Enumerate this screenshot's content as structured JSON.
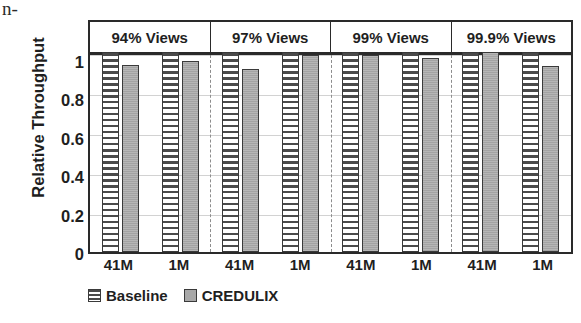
{
  "page_fragment": "n-",
  "chart_data": {
    "type": "bar",
    "title": "",
    "xlabel": "",
    "ylabel": "Relative Throughput",
    "ylim": [
      0,
      1
    ],
    "yticks": [
      0,
      0.2,
      0.4,
      0.6,
      0.8,
      1
    ],
    "ytick_labels": [
      "0",
      "0.2",
      "0.4",
      "0.6",
      "0.8",
      "1"
    ],
    "grid": true,
    "legend_position": "bottom-left",
    "group_labels": [
      "94% Views",
      "97% Views",
      "99% Views",
      "99.9% Views"
    ],
    "categories": [
      "41M",
      "1M",
      "41M",
      "1M",
      "41M",
      "1M",
      "41M",
      "1M"
    ],
    "series": [
      {
        "name": "Baseline",
        "color": "#ffffff",
        "pattern": "horizontal-stripes",
        "values": [
          1.0,
          1.0,
          1.0,
          1.0,
          1.0,
          1.0,
          1.0,
          1.0
        ]
      },
      {
        "name": "CREDULIX",
        "color": "#a8a8a8",
        "pattern": "solid",
        "values": [
          0.935,
          0.955,
          0.915,
          0.985,
          0.985,
          0.97,
          1.0,
          0.93
        ]
      }
    ],
    "groups": [
      {
        "label": "94% Views",
        "bars": [
          {
            "category": "41M",
            "baseline": 1.0,
            "credulix": 0.935
          },
          {
            "category": "1M",
            "baseline": 1.0,
            "credulix": 0.955
          }
        ]
      },
      {
        "label": "97% Views",
        "bars": [
          {
            "category": "41M",
            "baseline": 1.0,
            "credulix": 0.915
          },
          {
            "category": "1M",
            "baseline": 1.0,
            "credulix": 0.985
          }
        ]
      },
      {
        "label": "99% Views",
        "bars": [
          {
            "category": "41M",
            "baseline": 1.0,
            "credulix": 0.985
          },
          {
            "category": "1M",
            "baseline": 1.0,
            "credulix": 0.97
          }
        ]
      },
      {
        "label": "99.9% Views",
        "bars": [
          {
            "category": "41M",
            "baseline": 1.0,
            "credulix": 1.0
          },
          {
            "category": "1M",
            "baseline": 1.0,
            "credulix": 0.93
          }
        ]
      }
    ],
    "legend": [
      {
        "label": "Baseline",
        "swatch": "baseline"
      },
      {
        "label": "CREDULIX",
        "swatch": "credulix"
      }
    ]
  }
}
